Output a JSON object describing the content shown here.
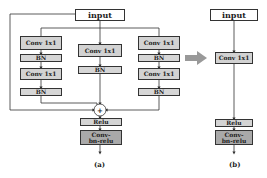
{
  "diagram_a": {
    "caption": "(a)",
    "input": "input",
    "left_branch": [
      "Conv 1x1",
      "BN",
      "Conv 1x1",
      "BN"
    ],
    "middle_branch": [
      "Conv 1x1",
      "BN"
    ],
    "right_branch": [
      "Conv 1x1",
      "BN",
      "Conv 1x1",
      "BN"
    ],
    "sum_symbol": "+",
    "relu": "Relu",
    "conv_bn_relu": "Conv-bn-relu"
  },
  "transform_arrow": "right-arrow",
  "diagram_b": {
    "caption": "(b)",
    "input": "input",
    "conv": "Conv 1x1",
    "relu": "Relu",
    "conv_bn_relu": "Conv-bn-relu"
  },
  "colors": {
    "box_light": "#d2d2d2",
    "box_dark": "#a9a9a9",
    "arrow": "#999999",
    "line": "#333333"
  }
}
